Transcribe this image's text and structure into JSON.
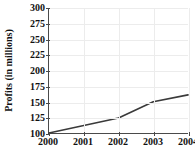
{
  "chart_data": {
    "type": "line",
    "title": "",
    "xlabel": "",
    "ylabel": "Profits (in millions)",
    "x": [
      2000,
      2001,
      2002,
      2003,
      2004
    ],
    "xtick_labels": [
      "2000",
      "2001",
      "2002",
      "2003",
      "2004"
    ],
    "values": [
      100,
      112,
      124,
      150,
      161
    ],
    "series": [
      {
        "name": "Profits",
        "values": [
          100,
          112,
          124,
          150,
          161
        ]
      }
    ],
    "ylim": [
      100,
      300
    ],
    "xlim": [
      2000,
      2004
    ],
    "ytick_labels": [
      "300",
      "275",
      "250",
      "225",
      "200",
      "175",
      "150",
      "125",
      "100"
    ],
    "ytick_values": [
      300,
      275,
      250,
      225,
      200,
      175,
      150,
      125,
      100
    ],
    "grid": true,
    "legend": "none",
    "line_color": "#3a3a3a",
    "grid_color": "#ececec",
    "axis_color": "#4a4a4a",
    "background_color": "#ffffff"
  }
}
